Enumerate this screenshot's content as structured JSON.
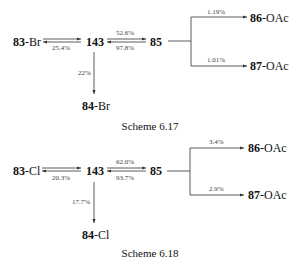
{
  "schemes": [
    {
      "caption": "Scheme 6.17",
      "start": {
        "num": "83",
        "suffix": "-Br"
      },
      "intermediate": {
        "num": "143"
      },
      "product": {
        "num": "85"
      },
      "side": {
        "num": "84",
        "suffix": "-Br"
      },
      "branch_top": {
        "num": "86",
        "suffix": "-OAc"
      },
      "branch_bottom": {
        "num": "87",
        "suffix": "-OAc"
      },
      "pct_start_reverse": "25.4%",
      "pct_forward": "52.6%",
      "pct_reverse": "97.8%",
      "pct_side": "22%",
      "pct_branch_top": "1.19%",
      "pct_branch_bottom": "1.01%"
    },
    {
      "caption": "Scheme 6.18",
      "start": {
        "num": "83",
        "suffix": "-Cl"
      },
      "intermediate": {
        "num": "143"
      },
      "product": {
        "num": "85"
      },
      "side": {
        "num": "84",
        "suffix": "-Cl"
      },
      "branch_top": {
        "num": "86",
        "suffix": "-OAc"
      },
      "branch_bottom": {
        "num": "87",
        "suffix": "-OAc"
      },
      "pct_start_reverse": "20.3%",
      "pct_forward": "62.0%",
      "pct_reverse": "93.7%",
      "pct_side": "17.7%",
      "pct_branch_top": "3.4%",
      "pct_branch_bottom": "2.9%"
    }
  ]
}
